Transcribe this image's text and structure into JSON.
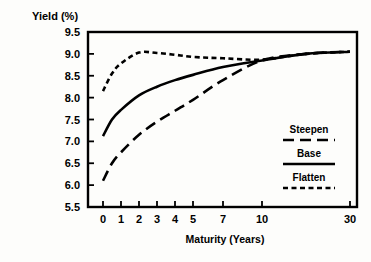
{
  "chart_data": {
    "type": "line",
    "title": "",
    "ylabel": "Yield (%)",
    "xlabel": "Maturity (Years)",
    "ylim": [
      5.5,
      9.5
    ],
    "ytick_labels": [
      "9.5",
      "9.0",
      "8.5",
      "8.0",
      "7.5",
      "7.0",
      "6.5",
      "6.0",
      "5.5"
    ],
    "ytick_values": [
      9.5,
      9.0,
      8.5,
      8.0,
      7.5,
      7.0,
      6.5,
      6.0,
      5.5
    ],
    "xtick_labels": [
      "0",
      "1",
      "2",
      "3",
      "4",
      "5",
      "7",
      "10",
      "30"
    ],
    "xtick_values": [
      0,
      1,
      2,
      3,
      4,
      5,
      7,
      10,
      30
    ],
    "x_scale": "compressed-log",
    "grid": false,
    "legend_position": "inside-right",
    "x": [
      0,
      0.5,
      1,
      2,
      3,
      4,
      5,
      7,
      10,
      20,
      30
    ],
    "series": [
      {
        "name": "Steepen",
        "style": "long-dash",
        "color": "#000000",
        "values": [
          6.1,
          6.5,
          6.75,
          7.15,
          7.45,
          7.7,
          7.95,
          8.4,
          8.85,
          9.0,
          9.05
        ]
      },
      {
        "name": "Base",
        "style": "solid",
        "color": "#000000",
        "values": [
          7.12,
          7.5,
          7.72,
          8.05,
          8.25,
          8.4,
          8.52,
          8.7,
          8.85,
          9.0,
          9.05
        ]
      },
      {
        "name": "Flatten",
        "style": "short-dash",
        "color": "#000000",
        "values": [
          8.15,
          8.55,
          8.78,
          9.03,
          9.02,
          8.98,
          8.93,
          8.9,
          8.87,
          9.0,
          9.05
        ]
      }
    ]
  },
  "legend": {
    "items": [
      {
        "label": "Steepen",
        "style": "long-dash"
      },
      {
        "label": "Base",
        "style": "solid"
      },
      {
        "label": "Flatten",
        "style": "short-dash"
      }
    ]
  }
}
